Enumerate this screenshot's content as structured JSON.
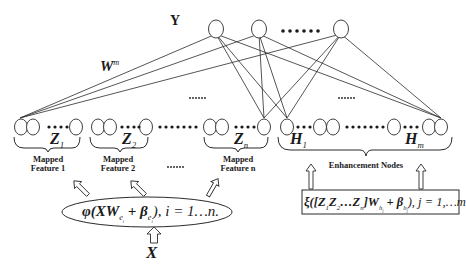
{
  "diagram": {
    "output_label": "Y",
    "weight_label": "W",
    "weight_superscript": "m",
    "output_nodes_ellipsis": "••••••",
    "hidden_ellipsis_left": "••••••",
    "hidden_ellipsis_right": "••••••",
    "mapped_groups": [
      {
        "symbol": "Z",
        "subscript": "1",
        "caption_line1": "Mapped",
        "caption_line2": "Feature 1"
      },
      {
        "symbol": "Z",
        "subscript": "2",
        "caption_line1": "Mapped",
        "caption_line2": "Feature 2"
      },
      {
        "symbol": "Z",
        "subscript": "n",
        "caption_line1": "Mapped",
        "caption_line2": "Feature n"
      }
    ],
    "mapped_ellipsis": "••••••",
    "enhancement": {
      "first_symbol": "H",
      "first_subscript": "1",
      "last_symbol": "H",
      "last_subscript": "m",
      "caption": "Enhancement Nodes"
    },
    "mapping_formula": {
      "prefix": "φ(XW",
      "w_sub": "e",
      "w_subsub": "i",
      "plus": " + β",
      "b_sub": "e",
      "b_subsub": "i",
      "suffix": "), i = 1…n."
    },
    "enhancement_formula": {
      "prefix": "ξ([Z",
      "z1_sub": "1",
      "z2": "Z",
      "z2_sub": "2",
      "mid": "…Z",
      "zn_sub": "n",
      "after": "]W",
      "w_sub": "h",
      "w_subsub": "j",
      "plus": " + β",
      "b_sub": "h",
      "b_subsub": "j",
      "suffix": "), j = 1,…m"
    },
    "input_label": "X",
    "colors": {
      "stroke": "#2a2a2a",
      "background": "#ffffff",
      "text": "#1a1a1a"
    }
  }
}
